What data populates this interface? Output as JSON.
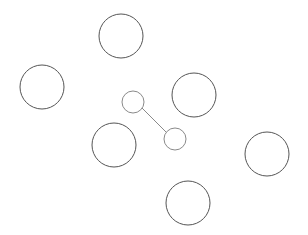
{
  "canvas": {
    "width": 308,
    "height": 235,
    "background": "#ffffff"
  },
  "colors": {
    "large_circle_stroke": "#555555",
    "small_circle_stroke": "#8a8a8a",
    "link_stroke": "#8a8a8a"
  },
  "large_circles": [
    {
      "cx": 121,
      "cy": 36,
      "r": 22
    },
    {
      "cx": 42,
      "cy": 87,
      "r": 22
    },
    {
      "cx": 194,
      "cy": 95,
      "r": 22
    },
    {
      "cx": 114,
      "cy": 145,
      "r": 22
    },
    {
      "cx": 267,
      "cy": 154,
      "r": 22
    },
    {
      "cx": 188,
      "cy": 203,
      "r": 22
    }
  ],
  "small_circles": [
    {
      "cx": 133,
      "cy": 102,
      "r": 11
    },
    {
      "cx": 175,
      "cy": 139,
      "r": 11
    }
  ],
  "links": [
    {
      "x1": 142,
      "y1": 108,
      "x2": 166,
      "y2": 132
    }
  ]
}
